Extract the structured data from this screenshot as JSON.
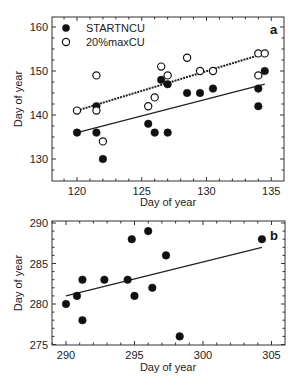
{
  "chart_data": [
    {
      "type": "scatter",
      "panel_label": "a",
      "xlabel": "Day of year",
      "ylabel": "Day of year",
      "xlim": [
        118,
        136
      ],
      "ylim": [
        125,
        162
      ],
      "xticks": [
        120,
        125,
        130,
        135
      ],
      "yticks": [
        130,
        140,
        150,
        160
      ],
      "grid": false,
      "legend_position": "upper-left",
      "series": [
        {
          "name": "STARTNCU",
          "marker": "filled-circle",
          "points": [
            [
              120,
              136
            ],
            [
              121.5,
              142
            ],
            [
              121.5,
              136
            ],
            [
              122,
              130
            ],
            [
              125.5,
              138
            ],
            [
              126,
              136
            ],
            [
              126.5,
              148
            ],
            [
              127,
              147
            ],
            [
              127,
              136
            ],
            [
              128.5,
              145
            ],
            [
              129.5,
              145
            ],
            [
              130.5,
              146
            ],
            [
              134,
              146
            ],
            [
              134,
              142
            ],
            [
              134.5,
              150
            ]
          ],
          "fit_line": {
            "style": "solid",
            "x": [
              120,
              134.5
            ],
            "y": [
              136,
              147
            ]
          }
        },
        {
          "name": "20%maxCU",
          "marker": "open-circle",
          "points": [
            [
              120,
              141
            ],
            [
              121.5,
              149
            ],
            [
              121.5,
              141
            ],
            [
              122,
              134
            ],
            [
              125.5,
              142
            ],
            [
              126,
              144
            ],
            [
              126.5,
              151
            ],
            [
              127,
              149
            ],
            [
              128.5,
              153
            ],
            [
              129.5,
              150
            ],
            [
              130.5,
              150
            ],
            [
              134,
              154
            ],
            [
              134.5,
              154
            ],
            [
              134,
              149
            ]
          ],
          "fit_line": {
            "style": "dashed",
            "x": [
              120,
              134.5
            ],
            "y": [
              141,
              154
            ]
          }
        }
      ]
    },
    {
      "type": "scatter",
      "panel_label": "b",
      "xlabel": "Day of year",
      "ylabel": "Day of year",
      "xlim": [
        289,
        306
      ],
      "ylim": [
        275,
        290
      ],
      "xticks": [
        290,
        295,
        300,
        305
      ],
      "yticks": [
        275,
        280,
        285,
        290
      ],
      "grid": false,
      "series": [
        {
          "name": "STARTNCU",
          "marker": "filled-circle",
          "points": [
            [
              290,
              280
            ],
            [
              290.8,
              281
            ],
            [
              291.2,
              283
            ],
            [
              291.2,
              278
            ],
            [
              292.8,
              283
            ],
            [
              294.5,
              283
            ],
            [
              294.8,
              288
            ],
            [
              295,
              281
            ],
            [
              296,
              289
            ],
            [
              296.3,
              282
            ],
            [
              297.3,
              286
            ],
            [
              298.3,
              276
            ],
            [
              304.3,
              288
            ]
          ],
          "fit_line": {
            "style": "solid",
            "x": [
              290,
              304.3
            ],
            "y": [
              281,
              287
            ]
          }
        }
      ]
    }
  ],
  "legend": {
    "filled": "STARTNCU",
    "open": "20%maxCU"
  },
  "labels": {
    "a_panel": "a",
    "b_panel": "b",
    "a_xlabel": "Day of year",
    "a_ylabel": "Day of year",
    "b_xlabel": "Day of year",
    "b_ylabel": "Day of year",
    "a_xticks": [
      "120",
      "125",
      "130",
      "135"
    ],
    "a_yticks": [
      "130",
      "140",
      "150",
      "160"
    ],
    "b_xticks": [
      "290",
      "295",
      "300",
      "305"
    ],
    "b_yticks": [
      "275",
      "280",
      "285",
      "290"
    ]
  }
}
